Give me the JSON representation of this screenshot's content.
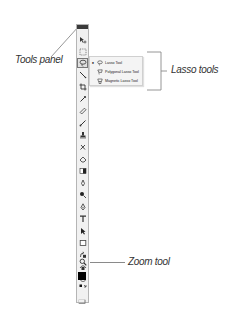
{
  "callouts": {
    "tools_panel": "Tools panel",
    "lasso_tools": "Lasso tools",
    "zoom_tool": "Zoom tool"
  },
  "tools_panel": {
    "tools": [
      {
        "name": "move-tool",
        "glyph": "▸✛"
      },
      {
        "name": "marquee-tool",
        "glyph": "⬚"
      },
      {
        "name": "lasso-tool",
        "glyph": "lasso",
        "selected": true
      },
      {
        "name": "quick-selection-tool",
        "glyph": "✎"
      },
      {
        "name": "crop-tool",
        "glyph": "⌗"
      },
      {
        "name": "eyedropper-tool",
        "glyph": "⁄"
      },
      {
        "name": "healing-brush-tool",
        "glyph": "✐"
      },
      {
        "name": "brush-tool",
        "glyph": "∕"
      },
      {
        "name": "clone-stamp-tool",
        "glyph": "♜"
      },
      {
        "name": "history-brush-tool",
        "glyph": "✗"
      },
      {
        "name": "eraser-tool",
        "glyph": "◇"
      },
      {
        "name": "gradient-tool",
        "glyph": "▮"
      },
      {
        "name": "blur-tool",
        "glyph": "◊"
      },
      {
        "name": "dodge-tool",
        "glyph": "●"
      },
      {
        "name": "pen-tool",
        "glyph": "♁"
      },
      {
        "name": "type-tool",
        "glyph": "T"
      },
      {
        "name": "path-selection-tool",
        "glyph": "▸"
      },
      {
        "name": "shape-tool",
        "glyph": "□"
      },
      {
        "name": "3d-rotate-tool",
        "glyph": "ᔓ"
      },
      {
        "name": "3d-orbit-tool",
        "glyph": "ᔕ"
      },
      {
        "name": "hand-tool",
        "glyph": "○"
      },
      {
        "name": "zoom-tool",
        "glyph": "⌕"
      },
      {
        "name": "default-colors",
        "glyph": "■↰"
      }
    ],
    "foreground_color": "#000000"
  },
  "lasso_menu": {
    "items": [
      {
        "label": "Lasso Tool",
        "active": true
      },
      {
        "label": "Polygonal Lasso Tool",
        "active": false
      },
      {
        "label": "Magnetic Lasso Tool",
        "active": false
      }
    ]
  },
  "colors": {
    "titlebar": "#3a3a3a",
    "panel_bg": "#f1f1f1",
    "callout_line": "#8a8a8a"
  }
}
